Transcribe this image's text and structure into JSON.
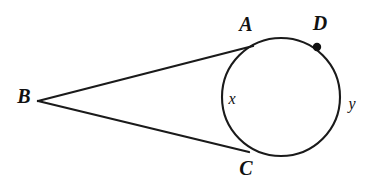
{
  "diagram": {
    "type": "geometry-figure",
    "background_color": "#ffffff",
    "stroke_color": "#1a1a1a",
    "canvas": {
      "width": 372,
      "height": 185
    },
    "circle": {
      "name": "circle",
      "center_x": 281,
      "center_y": 97,
      "radius": 59,
      "stroke_width": 2.1
    },
    "points": [
      {
        "id": "B",
        "label": "B",
        "role": "external-vertex",
        "x": 38,
        "y": 101,
        "label_x": 24,
        "label_y": 98
      },
      {
        "id": "A",
        "label": "A",
        "role": "tangent-point",
        "x": 252,
        "y": 47,
        "label_x": 246,
        "label_y": 26
      },
      {
        "id": "C",
        "label": "C",
        "role": "tangent-point",
        "x": 247,
        "y": 152,
        "label_x": 246,
        "label_y": 170
      },
      {
        "id": "D",
        "label": "D",
        "role": "point-on-circle",
        "x": 317,
        "y": 47,
        "label_x": 320,
        "label_y": 25
      }
    ],
    "marker_dot": {
      "name": "point-d-dot",
      "x": 317,
      "y": 47,
      "radius": 4.2,
      "color": "#111111"
    },
    "segments": [
      {
        "id": "BA",
        "label": "",
        "from": "B",
        "to": "A",
        "x1": 38,
        "y1": 101,
        "x2": 253,
        "y2": 46
      },
      {
        "id": "BC",
        "label": "",
        "from": "B",
        "to": "C",
        "x1": 38,
        "y1": 101,
        "x2": 249,
        "y2": 152
      }
    ],
    "arc_labels": [
      {
        "id": "x",
        "label": "x",
        "arc": "minor-arc-AC",
        "x": 232,
        "y": 100
      },
      {
        "id": "y",
        "label": "y",
        "arc": "arc-through-D",
        "x": 352,
        "y": 105
      }
    ]
  }
}
